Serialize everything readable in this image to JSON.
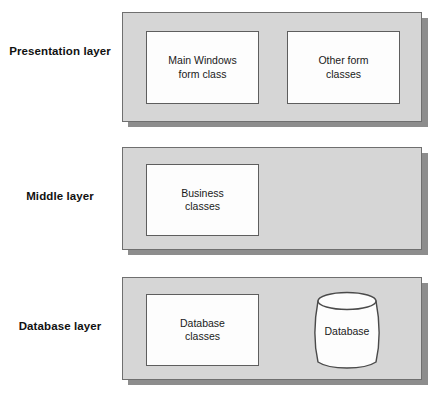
{
  "diagram": {
    "colors": {
      "panel_fill": "#d6d6d6",
      "panel_border": "#6f6f6f",
      "panel_shadow": "#8d8d8d",
      "box_fill": "#fdfdfd",
      "box_border": "#5e5e5e",
      "text": "#1a1a1a",
      "background": "#ffffff"
    },
    "layers": [
      {
        "id": "presentation",
        "label": "Presentation\nlayer",
        "boxes": [
          {
            "id": "main-windows-form-class",
            "text": "Main Windows\nform class"
          },
          {
            "id": "other-form-classes",
            "text": "Other form\nclasses"
          }
        ]
      },
      {
        "id": "middle",
        "label": "Middle layer",
        "boxes": [
          {
            "id": "business-classes",
            "text": "Business\nclasses"
          }
        ]
      },
      {
        "id": "database",
        "label": "Database layer",
        "boxes": [
          {
            "id": "database-classes",
            "text": "Database\nclasses"
          }
        ],
        "cylinder": {
          "id": "database-store",
          "text": "Database"
        }
      }
    ]
  }
}
